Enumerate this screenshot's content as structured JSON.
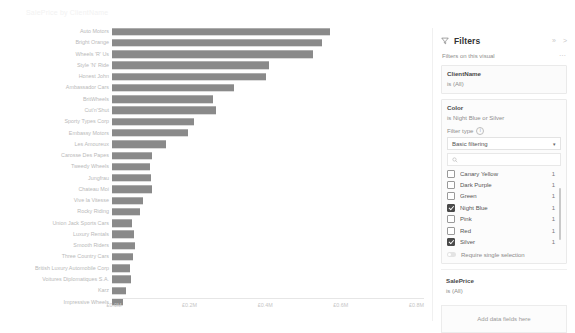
{
  "visual": {
    "title": "SalePrice by ClientName",
    "axis": {
      "ticks": [
        "£0.0M",
        "£0.2M",
        "£0.4M",
        "£0.6M",
        "£0.8M"
      ],
      "tick_values": [
        0,
        0.2,
        0.4,
        0.6,
        0.8
      ]
    }
  },
  "chart_data": {
    "type": "bar",
    "orientation": "horizontal",
    "title": "SalePrice by ClientName",
    "xlabel": "SalePrice",
    "ylabel": "ClientName",
    "xlim": [
      0,
      0.82
    ],
    "unit": "£M",
    "grid": false,
    "legend": "none",
    "bar_color": "#8a8a8a",
    "categories": [
      "Auto Motors",
      "Bright Orange",
      "Wheels 'R' Us",
      "Style 'N' Ride",
      "Honest John",
      "Ambassador Cars",
      "BritWheels",
      "Cut'n'Shut",
      "Sporty Types Corp",
      "Embassy Motors",
      "Les Amoureux",
      "Carosse Des Papes",
      "Tweedy Wheels",
      "Jungfrau",
      "Chateau Moi",
      "Vive la Vitesse",
      "Rocky Riding",
      "Union Jack Sports Cars",
      "Luxury Rentals",
      "Smooth Riders",
      "Three Country Cars",
      "British Luxury Automobile Corp",
      "Voitures Diplomatiques S.A.",
      "Karz",
      "Impressive Wheels"
    ],
    "values": [
      0.577,
      0.555,
      0.532,
      0.414,
      0.408,
      0.324,
      0.267,
      0.275,
      0.218,
      0.2,
      0.142,
      0.105,
      0.1,
      0.103,
      0.105,
      0.082,
      0.073,
      0.053,
      0.058,
      0.06,
      0.055,
      0.047,
      0.05,
      0.037,
      0.029
    ]
  },
  "filters": {
    "header": {
      "title": "Filters",
      "funnel_icon": "funnel-icon",
      "collapse_icon": "pin-icon",
      "expand_icon": "chevron-right-icon"
    },
    "section_label": "Filters on this visual",
    "more_icon": "ellipsis-icon",
    "cards": [
      {
        "field": "ClientName",
        "state": "is (All)"
      }
    ],
    "color_card": {
      "field": "Color",
      "state": "is Night Blue or Silver",
      "filter_type_label": "Filter type",
      "info_icon": "info-icon",
      "filter_type_value": "Basic filtering",
      "caret_icon": "chevron-down-icon",
      "search_icon": "search-icon",
      "search_placeholder": "",
      "items": [
        {
          "label": "Canary Yellow",
          "count": "1",
          "checked": false
        },
        {
          "label": "Dark Purple",
          "count": "1",
          "checked": false
        },
        {
          "label": "Green",
          "count": "1",
          "checked": false
        },
        {
          "label": "Night Blue",
          "count": "1",
          "checked": true
        },
        {
          "label": "Pink",
          "count": "1",
          "checked": false
        },
        {
          "label": "Red",
          "count": "1",
          "checked": false
        },
        {
          "label": "Silver",
          "count": "1",
          "checked": true
        }
      ],
      "single_selection_label": "Require single selection"
    },
    "sale_price_card": {
      "field": "SalePrice",
      "state": "is (All)"
    },
    "drop_zone_label": "Add data fields here"
  },
  "colors": {
    "bar": "#8a8a8a",
    "text": "#605e5c",
    "accent": "#4a4a4a"
  }
}
